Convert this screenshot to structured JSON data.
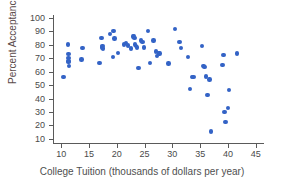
{
  "chart_data": {
    "type": "scatter",
    "title": "",
    "xlabel": "College Tuition (thousands of dollars per year)",
    "ylabel": "Percent Acceptance",
    "xlim": [
      8.5,
      46.5
    ],
    "ylim": [
      7,
      102
    ],
    "xticks": [
      10,
      15,
      20,
      25,
      30,
      35,
      40,
      45
    ],
    "yticks": [
      10,
      20,
      30,
      40,
      50,
      60,
      70,
      80,
      90,
      100
    ],
    "xtick_labels": [
      "10",
      "15",
      "20",
      "25",
      "30",
      "35",
      "40",
      "45"
    ],
    "ytick_labels": [
      "10",
      "20",
      "30",
      "40",
      "50",
      "60",
      "70",
      "80",
      "90",
      "100"
    ],
    "grid": false,
    "legend": null,
    "marker_color": "#3363c6",
    "marker_size": 4.4,
    "points": [
      [
        10.4,
        56
      ],
      [
        11.2,
        80
      ],
      [
        11.3,
        73
      ],
      [
        11.3,
        70
      ],
      [
        11.3,
        68
      ],
      [
        11.3,
        67
      ],
      [
        11.4,
        64
      ],
      [
        13.8,
        77.5
      ],
      [
        13.6,
        69
      ],
      [
        16.9,
        66.5
      ],
      [
        17.2,
        85
      ],
      [
        17.3,
        78
      ],
      [
        17.4,
        79
      ],
      [
        17.5,
        77
      ],
      [
        18.8,
        88
      ],
      [
        19.3,
        71
      ],
      [
        19.4,
        90
      ],
      [
        19.6,
        84.5
      ],
      [
        20.2,
        74
      ],
      [
        21.3,
        80
      ],
      [
        21.6,
        81
      ],
      [
        22.0,
        79.5
      ],
      [
        22.6,
        77
      ],
      [
        22.9,
        86
      ],
      [
        23.1,
        86.5
      ],
      [
        23.2,
        85
      ],
      [
        23.3,
        80
      ],
      [
        23.4,
        79
      ],
      [
        23.6,
        78
      ],
      [
        23.9,
        62.5
      ],
      [
        24.3,
        83
      ],
      [
        24.6,
        82
      ],
      [
        24.9,
        78
      ],
      [
        25.6,
        90
      ],
      [
        26.0,
        66.5
      ],
      [
        26.6,
        83
      ],
      [
        27.0,
        75
      ],
      [
        27.2,
        71.5
      ],
      [
        27.6,
        74
      ],
      [
        27.7,
        73.5
      ],
      [
        29.3,
        66
      ],
      [
        30.5,
        91.5
      ],
      [
        31.3,
        82
      ],
      [
        31.5,
        77.5
      ],
      [
        32.8,
        71
      ],
      [
        33.2,
        47
      ],
      [
        33.5,
        56
      ],
      [
        33.8,
        56
      ],
      [
        35.3,
        79
      ],
      [
        35.6,
        64
      ],
      [
        35.8,
        63.5
      ],
      [
        36.0,
        56.5
      ],
      [
        36.3,
        42.5
      ],
      [
        36.7,
        54
      ],
      [
        36.9,
        15.5
      ],
      [
        39.0,
        65
      ],
      [
        39.2,
        72.5
      ],
      [
        39.4,
        30
      ],
      [
        39.6,
        22.5
      ],
      [
        40.0,
        33
      ],
      [
        40.2,
        46.5
      ],
      [
        41.6,
        73.5
      ]
    ]
  },
  "axes": {
    "xlabel": "College Tuition (thousands of dollars per year)",
    "ylabel": "Percent Acceptance"
  }
}
